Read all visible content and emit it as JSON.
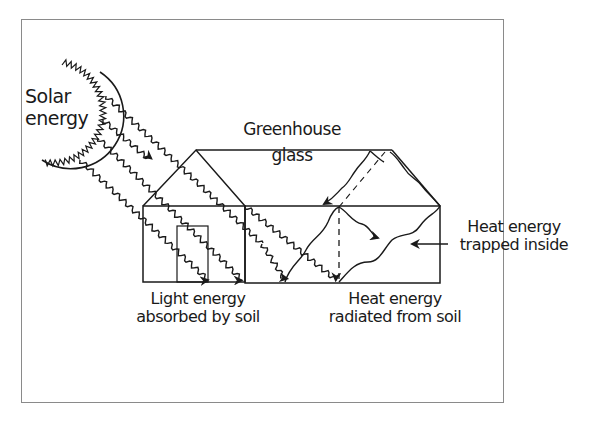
{
  "diagram": {
    "labels": {
      "solar_line1": "Solar",
      "solar_line2": "energy",
      "glass_line1": "Greenhouse",
      "glass_line2": "glass",
      "trapped_line1": "Heat energy",
      "trapped_line2": "trapped inside",
      "light_line1": "Light energy",
      "light_line2": "absorbed by soil",
      "heat_line1": "Heat energy",
      "heat_line2": "radiated from soil"
    },
    "elements": {
      "sun": "sun-icon",
      "greenhouse": "greenhouse-structure",
      "door": "greenhouse-door",
      "light_rays": "light-ray-arrows",
      "heat_waves": "heat-wave-arrows"
    },
    "colors": {
      "ink": "#1a1a1a",
      "frame": "#8a8a8a",
      "background": "#ffffff"
    }
  }
}
